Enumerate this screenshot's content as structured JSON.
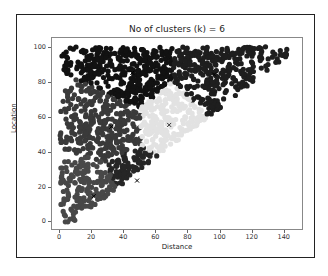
{
  "chart_data": {
    "type": "scatter",
    "title": "No of clusters (k) = 6",
    "xlabel": "Distance",
    "ylabel": "Location",
    "xlim": [
      -5,
      152
    ],
    "ylim": [
      -5,
      106
    ],
    "xticks": [
      "0",
      "20",
      "40",
      "60",
      "80",
      "100",
      "120",
      "140"
    ],
    "yticks": [
      "0",
      "20",
      "40",
      "60",
      "80",
      "100"
    ],
    "grid": false,
    "legend": null,
    "centroid_marker": "x",
    "clusters": [
      {
        "name": "cluster-top-middle",
        "color": "#121212",
        "centroid": [
          45,
          86
        ]
      },
      {
        "name": "cluster-top-right",
        "color": "#1e1e1e",
        "centroid": [
          96,
          85
        ]
      },
      {
        "name": "cluster-middle-left",
        "color": "#3a3a3a",
        "centroid": [
          32,
          55
        ]
      },
      {
        "name": "cluster-center",
        "color": "#e2e2e2",
        "centroid": [
          68,
          56
        ]
      },
      {
        "name": "cluster-bottom-center",
        "color": "#262626",
        "centroid": [
          48,
          24
        ]
      },
      {
        "name": "cluster-bottom-left",
        "color": "#484848",
        "centroid": [
          21,
          15
        ]
      }
    ],
    "data_region": "points fill the triangle x >= 0, 0 <= y <= 100, y >= 0.72*x - 5 (roughly x in 0-143, y in 0-100)"
  }
}
